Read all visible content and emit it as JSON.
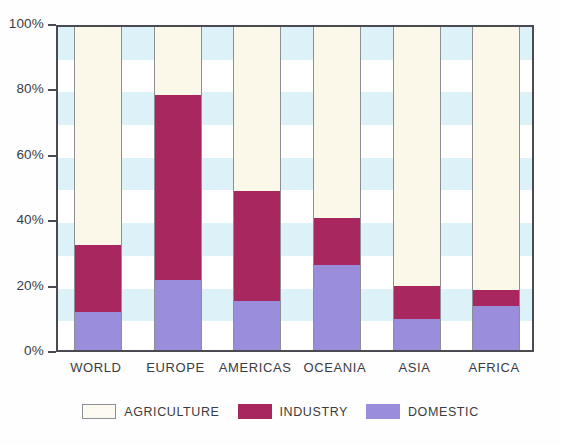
{
  "chart_data": {
    "type": "bar",
    "title": "",
    "subtitle": "",
    "xlabel": "",
    "ylabel": "",
    "stacked": true,
    "stack_total": 100,
    "ylim": [
      0,
      100
    ],
    "ytick_labels": [
      "0%",
      "20%",
      "40%",
      "60%",
      "80%",
      "100%"
    ],
    "ytick_values": [
      0,
      20,
      40,
      60,
      80,
      100
    ],
    "grid": "horizontal-bands",
    "legend_position": "bottom-center",
    "categories": [
      "WORLD",
      "EUROPE",
      "AMERICAS",
      "OCEANIA",
      "ASIA",
      "AFRICA"
    ],
    "series": [
      {
        "name": "DOMESTIC",
        "color": "#9a8edc",
        "values": [
          11.5,
          21.5,
          15.0,
          26.0,
          9.5,
          13.5
        ]
      },
      {
        "name": "INDUSTRY",
        "color": "#a9275f",
        "values": [
          20.5,
          56.5,
          33.5,
          14.5,
          10.0,
          5.0
        ]
      },
      {
        "name": "AGRICULTURE",
        "color": "#fbf8ea",
        "values": [
          68.0,
          22.0,
          51.5,
          59.5,
          80.5,
          81.5
        ]
      }
    ],
    "cumulative_tops": {
      "domestic": [
        11.5,
        21.5,
        15.0,
        26.0,
        9.5,
        13.5
      ],
      "industry": [
        32.0,
        78.0,
        48.5,
        40.5,
        19.5,
        18.5
      ],
      "agriculture": [
        100,
        100,
        100,
        100,
        100,
        100
      ]
    }
  },
  "legend": {
    "items": [
      {
        "label": "AGRICULTURE",
        "swatch": "agriculture"
      },
      {
        "label": "INDUSTRY",
        "swatch": "industry"
      },
      {
        "label": "DOMESTIC",
        "swatch": "domestic"
      }
    ]
  },
  "colors": {
    "agriculture": "#fbf8ea",
    "industry": "#a9275f",
    "domestic": "#9a8edc",
    "band": "#ddf2f8",
    "frame": "#4a4a52",
    "bar_outline": "#8e8e95",
    "text": "#3b3b41"
  }
}
